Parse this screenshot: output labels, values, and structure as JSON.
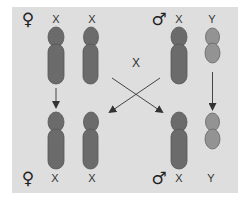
{
  "diagram": {
    "type": "sex-chromosome inheritance",
    "colors": {
      "background": "#dedede",
      "x_chromosome": "#6b6b6b",
      "y_chromosome": "#939393",
      "outline": "#555555",
      "arrow": "#444444"
    },
    "top_row": {
      "female_symbol": "♀",
      "female_labels": [
        "X",
        "X"
      ],
      "male_symbol": "♂",
      "male_labels": [
        "X",
        "Y"
      ]
    },
    "center_label": "X",
    "bottom_row": {
      "female_symbol": "♀",
      "female_labels": [
        "X",
        "X"
      ],
      "male_symbol": "♂",
      "male_labels": [
        "X",
        "Y"
      ]
    }
  }
}
